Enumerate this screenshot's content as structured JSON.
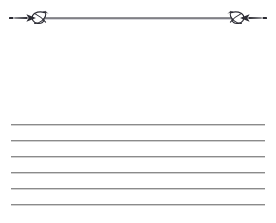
{
  "page": {
    "width": 276,
    "height": 223,
    "background_color": "#ffffff"
  },
  "ornament": {
    "name": "knot-flourish-divider",
    "description": "Horizontal rule flanked by mirrored looping knot flourishes with tapered arrow tips",
    "stroke_color": "#2b2b33",
    "rule_color": "#3a3a42",
    "center_y": 18,
    "left_tip_x": 9,
    "right_tip_x": 267,
    "left_knot_center_x": 37,
    "right_knot_center_x": 239,
    "rule_start_x": 45,
    "rule_end_x": 231
  },
  "rules": {
    "name": "writing-lines",
    "color": "#8b8b8b",
    "shadow_color": "#aaaaaa",
    "left_x": 11,
    "right_x": 265,
    "thickness": 1,
    "spacing": 16,
    "count": 6,
    "y_positions": [
      124,
      140,
      156,
      172,
      188,
      204
    ]
  }
}
